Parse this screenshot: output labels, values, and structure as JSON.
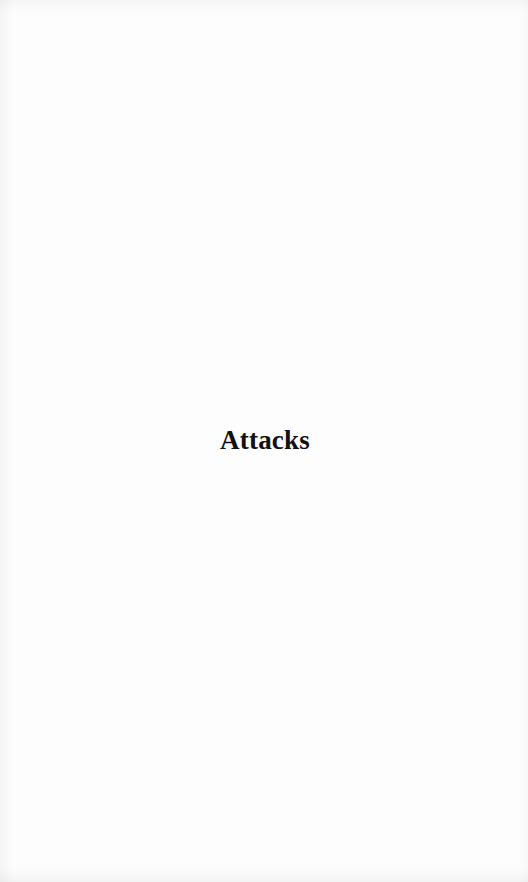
{
  "page": {
    "section_title": "Attacks"
  }
}
